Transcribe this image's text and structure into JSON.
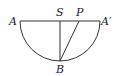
{
  "diagram": {
    "labels": {
      "A": "A",
      "S": "S",
      "P": "P",
      "A_prime": "A′",
      "B": "B"
    },
    "elements": [
      "diameter AA'",
      "semicircular arc from A through B to A'",
      "segment SB",
      "segment PB"
    ]
  }
}
